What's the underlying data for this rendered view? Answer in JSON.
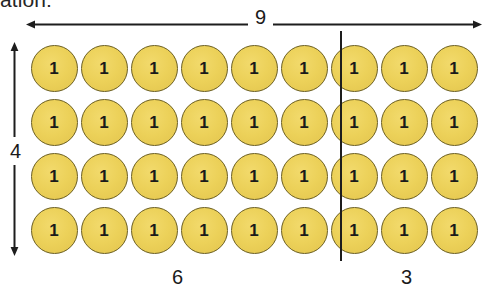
{
  "heading": {
    "clipped_text": "ation:"
  },
  "top_measure": {
    "label": "9",
    "arrow_icon": "double-headed-horizontal-arrow-icon"
  },
  "left_measure": {
    "label": "4",
    "arrow_icon": "double-headed-vertical-arrow-icon"
  },
  "bottom_measures": [
    {
      "label": "6"
    },
    {
      "label": "3"
    }
  ],
  "grid": {
    "rows": 4,
    "columns": 9,
    "split_after_column": 6,
    "counter_value": "1",
    "total_counters": 36,
    "counter_color": "#ecd159",
    "counter_outline_color": "#6b5e20",
    "divider_color": "#1d1d1d"
  },
  "chart_data": {
    "type": "table",
    "title": "",
    "categories": [
      "left group",
      "right group"
    ],
    "values": [
      6,
      3
    ],
    "rows": 4,
    "columns": 9,
    "total": 36,
    "annotations": [
      "9",
      "4",
      "6",
      "3"
    ]
  }
}
